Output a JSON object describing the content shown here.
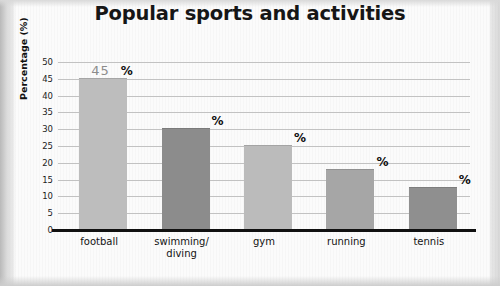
{
  "title": "Popular sports and activities",
  "chart_data": {
    "type": "bar",
    "title": "Popular sports and activities",
    "xlabel": "",
    "ylabel": "Percentage (%)",
    "categories": [
      "football",
      "swimming/\ndiving",
      "gym",
      "running",
      "tennis"
    ],
    "values": [
      45,
      30,
      25,
      18,
      12.5
    ],
    "ylim": [
      0,
      50
    ],
    "yticks": [
      0,
      5,
      10,
      15,
      20,
      25,
      30,
      35,
      40,
      45,
      50
    ],
    "ytick_labels": [
      "0",
      "5",
      "10",
      "15",
      "20",
      "25",
      "30",
      "35",
      "40",
      "45",
      "50"
    ],
    "grid": true,
    "legend": false,
    "bar_colors": [
      "#bdbdbd",
      "#8c8c8c",
      "#bbbbbb",
      "#a6a6a6",
      "#8f8f8f"
    ],
    "annotations": [
      {
        "category": "football",
        "value_text": "45",
        "unit_text": "%"
      },
      {
        "category": "swimming/diving",
        "value_text": "",
        "unit_text": "%"
      },
      {
        "category": "gym",
        "value_text": "",
        "unit_text": "%"
      },
      {
        "category": "running",
        "value_text": "",
        "unit_text": "%"
      },
      {
        "category": "tennis",
        "value_text": "",
        "unit_text": "%"
      }
    ]
  },
  "axis": {
    "y_title": "Percentage (%)",
    "ticks": [
      "50",
      "45",
      "40",
      "35",
      "30",
      "25",
      "20",
      "15",
      "10",
      "5",
      "0"
    ]
  },
  "x_labels": [
    {
      "line1": "football",
      "line2": ""
    },
    {
      "line1": "swimming/",
      "line2": "diving"
    },
    {
      "line1": "gym",
      "line2": ""
    },
    {
      "line1": "running",
      "line2": ""
    },
    {
      "line1": "tennis",
      "line2": ""
    }
  ],
  "annotations": [
    {
      "value": "45",
      "unit": "%"
    },
    {
      "value": "",
      "unit": "%"
    },
    {
      "value": "",
      "unit": "%"
    },
    {
      "value": "",
      "unit": "%"
    },
    {
      "value": "",
      "unit": "%"
    }
  ],
  "colors": {
    "grid": "#c2c2c2",
    "axis": "#111111",
    "paper": "#fbfbfb",
    "value_text": "#8c8c8c",
    "unit_text": "#0d0d0d"
  }
}
